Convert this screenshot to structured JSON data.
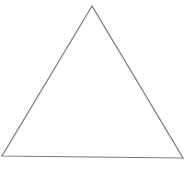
{
  "diagram": {
    "shape": "triangle",
    "vertices": {
      "top": [
        92,
        6
      ],
      "bottom_left": [
        2,
        156
      ],
      "bottom_right": [
        183,
        158
      ]
    },
    "stroke_color": "#7a7a7a",
    "fill_color": "#ffffff",
    "background": "#ffffff",
    "speck": [
      48,
      148
    ]
  }
}
